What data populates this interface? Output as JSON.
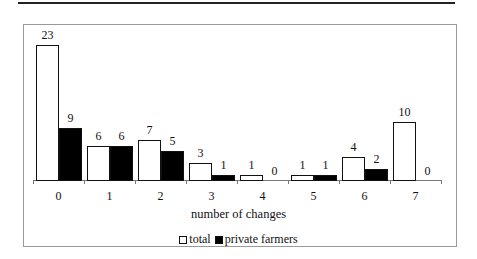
{
  "chart_data": {
    "type": "bar",
    "title": "",
    "xlabel": "number of changes",
    "ylabel": "",
    "categories": [
      "0",
      "1",
      "2",
      "3",
      "4",
      "5",
      "6",
      "7"
    ],
    "series": [
      {
        "name": "total",
        "color": "#ffffff",
        "values": [
          23,
          6,
          7,
          3,
          1,
          1,
          4,
          10
        ]
      },
      {
        "name": "private farmers",
        "color": "#000000",
        "values": [
          9,
          6,
          5,
          1,
          0,
          1,
          2,
          0
        ]
      }
    ],
    "ylim": [
      0,
      23
    ],
    "grid": false,
    "legend_position": "bottom",
    "data_labels": true
  },
  "axis": {
    "title": "number of changes"
  },
  "legend": {
    "items": [
      {
        "label": "total",
        "swatch": "white"
      },
      {
        "label": "private farmers",
        "swatch": "black"
      }
    ]
  }
}
